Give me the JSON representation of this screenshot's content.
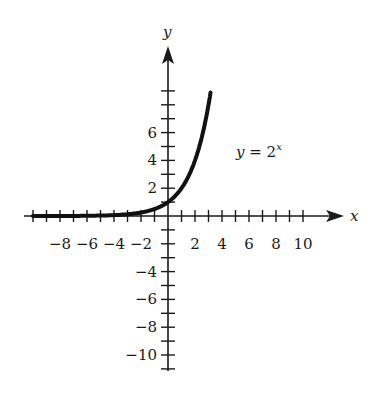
{
  "chart_data": {
    "type": "line",
    "title": "",
    "function_label": "y = 2^x",
    "label_base": "y = 2",
    "label_exponent": "x",
    "xlabel": "x",
    "ylabel": "y",
    "xlim": [
      -10,
      12
    ],
    "ylim": [
      -11,
      10
    ],
    "x_ticks": [
      -8,
      -6,
      -4,
      -2,
      2,
      4,
      6,
      8,
      10
    ],
    "x_tick_labels": [
      "−8",
      "−6",
      "−4",
      "−2",
      "2",
      "4",
      "6",
      "8",
      "10"
    ],
    "y_ticks": [
      2,
      4,
      6,
      -4,
      -6,
      -8,
      -10
    ],
    "y_tick_labels": [
      "2",
      "4",
      "6",
      "−4",
      "−6",
      "−8",
      "−10"
    ],
    "grid": false,
    "series": [
      {
        "name": "y = 2^x",
        "x": [
          -10,
          -8,
          -6,
          -4,
          -3,
          -2,
          -1,
          0,
          1,
          2,
          2.5,
          3.2
        ],
        "values": [
          0.001,
          0.004,
          0.016,
          0.0625,
          0.125,
          0.25,
          0.5,
          1,
          2,
          4,
          5.66,
          9.19
        ]
      }
    ],
    "colors": {
      "axis": "#1a1a1a",
      "curve": "#111111"
    }
  }
}
